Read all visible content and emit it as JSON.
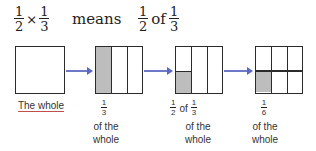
{
  "title": {
    "expression": {
      "a": {
        "num": "1",
        "den": "2"
      },
      "op": "×",
      "b": {
        "num": "1",
        "den": "3"
      }
    },
    "means_label": "means",
    "phrase": {
      "a": {
        "num": "1",
        "den": "2"
      },
      "of_label": "of",
      "b": {
        "num": "1",
        "den": "3"
      }
    }
  },
  "steps": [
    {
      "caption": "The whole"
    },
    {
      "fraction": {
        "num": "1",
        "den": "3"
      },
      "caption_line1": "of the",
      "caption_line2": "whole"
    },
    {
      "fraction_a": {
        "num": "1",
        "den": "2"
      },
      "of_label": "of",
      "fraction_b": {
        "num": "1",
        "den": "3"
      },
      "caption_line1": "of the",
      "caption_line2": "whole"
    },
    {
      "fraction": {
        "num": "1",
        "den": "6"
      },
      "caption_line1": "of the",
      "caption_line2": "whole"
    }
  ],
  "colors": {
    "shade": "#bdbdbd",
    "arrow": "#6d78c6",
    "outline": "#2b2b2b",
    "caption_red_underline": "#b04040"
  }
}
